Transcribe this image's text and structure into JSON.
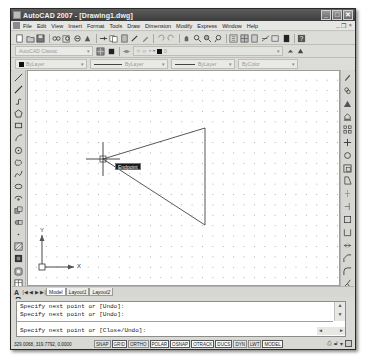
{
  "window": {
    "title": "AutoCAD 2007 - [Drawing1.dwg]",
    "controls": {
      "minimize": "_",
      "maximize": "□",
      "close": "✕"
    }
  },
  "menubar": {
    "items": [
      "File",
      "Edit",
      "View",
      "Insert",
      "Format",
      "Tools",
      "Draw",
      "Dimension",
      "Modify",
      "Express",
      "Window",
      "Help"
    ],
    "doc_controls": {
      "minimize": "_",
      "restore": "❐",
      "close": "×"
    }
  },
  "toolbars": {
    "standard": {
      "icons": [
        "new-icon",
        "open-icon",
        "save-icon",
        "plot-icon",
        "plot-preview-icon",
        "publish-icon",
        "3d-dwf-icon",
        "cut-icon",
        "copy-icon",
        "paste-icon",
        "match-properties-icon",
        "block-editor-icon",
        "undo-icon",
        "redo-icon",
        "pan-icon",
        "zoom-realtime-icon",
        "zoom-window-icon",
        "zoom-previous-icon",
        "properties-icon",
        "design-center-icon",
        "tool-palettes-icon",
        "sheet-set-icon",
        "markup-icon",
        "quickcalc-icon",
        "help-icon"
      ]
    },
    "workspaces": {
      "workspace_value": "AutoCAD Classic",
      "layer_value": "0"
    },
    "properties": {
      "color_value": "ByLayer",
      "linetype_value": "ByLayer",
      "lineweight_value": "ByLayer",
      "plotstyle_value": "ByColor"
    }
  },
  "left_toolbar": {
    "tools": [
      "line",
      "construction-line",
      "polyline",
      "polygon",
      "rectangle",
      "arc",
      "circle",
      "revision-cloud",
      "spline",
      "ellipse",
      "ellipse-arc",
      "insert-block",
      "make-block",
      "point",
      "hatch",
      "gradient",
      "region",
      "table",
      "multiline-text"
    ]
  },
  "right_toolbar": {
    "tools": [
      "erase",
      "copy",
      "mirror",
      "offset",
      "array",
      "move",
      "rotate",
      "scale",
      "stretch",
      "trim",
      "extend",
      "break-at-point",
      "break",
      "join",
      "chamfer",
      "fillet",
      "explode"
    ]
  },
  "canvas": {
    "osnap_tooltip": "Endpoint",
    "ucs": {
      "x_label": "X",
      "y_label": "Y"
    },
    "triangle": {
      "apex": [
        75,
        88
      ],
      "top_right": [
        177,
        57
      ],
      "bottom_right": [
        177,
        154
      ]
    }
  },
  "tabs": {
    "nav": [
      "|◀",
      "◀",
      "▶",
      "▶|"
    ],
    "items": [
      {
        "label": "Model",
        "active": true
      },
      {
        "label": "Layout1",
        "active": false
      },
      {
        "label": "Layout2",
        "active": false
      }
    ]
  },
  "command": {
    "history": [
      "Specify next point or [Undo]:",
      "Specify next point or [Undo]:"
    ],
    "prompt": "Specify next point or [Close/Undo]:"
  },
  "statusbar": {
    "coordinates": "329.0068, 319.7792, 0.0000",
    "toggles": [
      {
        "label": "SNAP",
        "on": false
      },
      {
        "label": "GRID",
        "on": true
      },
      {
        "label": "ORTHO",
        "on": false
      },
      {
        "label": "POLAR",
        "on": true
      },
      {
        "label": "OSNAP",
        "on": true
      },
      {
        "label": "OTRACK",
        "on": true
      },
      {
        "label": "DUCS",
        "on": true
      },
      {
        "label": "DYN",
        "on": false
      },
      {
        "label": "LWT",
        "on": false
      },
      {
        "label": "MODEL",
        "on": true
      }
    ]
  }
}
